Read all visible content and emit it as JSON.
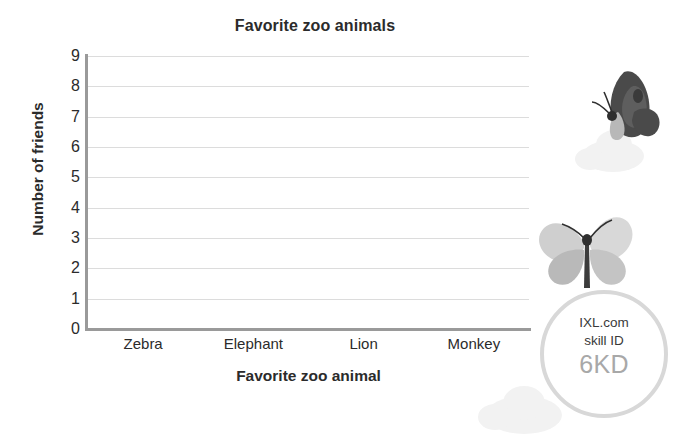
{
  "chart_data": {
    "type": "bar",
    "title": "Favorite zoo animals",
    "xlabel": "Favorite zoo animal",
    "ylabel": "Number of friends",
    "categories": [
      "Zebra",
      "Elephant",
      "Lion",
      "Monkey"
    ],
    "values": [
      0,
      0,
      0,
      0
    ],
    "yticks": [
      "9",
      "8",
      "7",
      "6",
      "5",
      "4",
      "3",
      "2",
      "1",
      "0"
    ],
    "ylim": [
      0,
      9
    ],
    "grid": true,
    "legend": "none",
    "note": "Empty bar graph template - no bars drawn, all categories at zero"
  },
  "badge": {
    "site": "IXL.com",
    "label": "skill ID",
    "skill_id": "6KD"
  },
  "colors": {
    "background": "#ffffff",
    "text": "#2b2b2b",
    "axis": "#9a9a9a",
    "gridline": "#dcdcdc",
    "badge_ring": "#d8d8d8",
    "badge_id": "#a8a8a8",
    "cloud": "#f2f2f2",
    "butterfly_dark": "#4a4a4a",
    "butterfly_light": "#c9c9c9"
  },
  "decorations": {
    "butterfly_dark_name": "butterfly-dark-icon",
    "butterfly_light_name": "butterfly-light-icon"
  }
}
